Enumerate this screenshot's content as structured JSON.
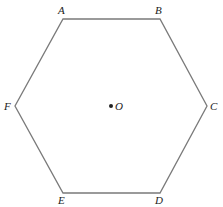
{
  "diagram": {
    "type": "regular hexagon",
    "stroke_color": "#7a7a7a",
    "vertices": [
      {
        "label": "A",
        "x": 63,
        "y": 19,
        "lx": 58,
        "ly": 14
      },
      {
        "label": "B",
        "x": 160,
        "y": 19,
        "lx": 155,
        "ly": 14
      },
      {
        "label": "C",
        "x": 207,
        "y": 106,
        "lx": 210,
        "ly": 110
      },
      {
        "label": "D",
        "x": 160,
        "y": 193,
        "lx": 155,
        "ly": 204
      },
      {
        "label": "E",
        "x": 63,
        "y": 193,
        "lx": 58,
        "ly": 204
      },
      {
        "label": "F",
        "x": 15,
        "y": 106,
        "lx": 4,
        "ly": 110
      }
    ],
    "center": {
      "label": "O",
      "x": 111,
      "y": 106,
      "lx": 115,
      "ly": 110
    }
  }
}
